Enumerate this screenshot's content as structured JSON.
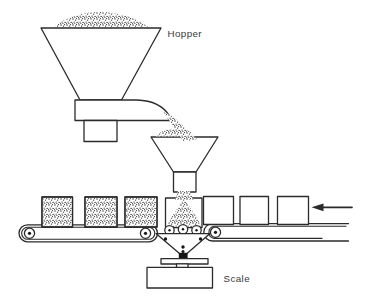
{
  "diagram": {
    "kind": "process-line-art",
    "labels": {
      "hopper": "Hopper",
      "scale": "Scale"
    },
    "colors": {
      "background": "#ffffff",
      "line": "#2b2b2b",
      "granule_dots": "#1c1c1c",
      "label_text": "#3a3a3a"
    },
    "flow_direction_arrow": "points-left"
  }
}
